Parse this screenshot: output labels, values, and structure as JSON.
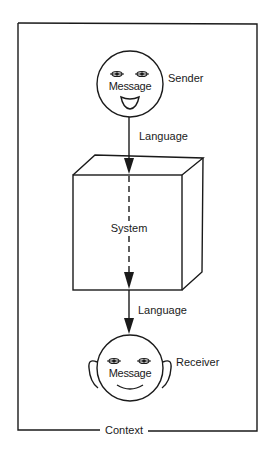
{
  "diagram": {
    "frame_label": "Context",
    "sender": {
      "label": "Sender",
      "face_text": "Message"
    },
    "arrow_top_label": "Language",
    "system": {
      "label": "System"
    },
    "arrow_bottom_label": "Language",
    "receiver": {
      "label": "Receiver",
      "face_text": "Message"
    },
    "colors": {
      "ink": "#1a1a1a",
      "background": "#ffffff"
    }
  }
}
